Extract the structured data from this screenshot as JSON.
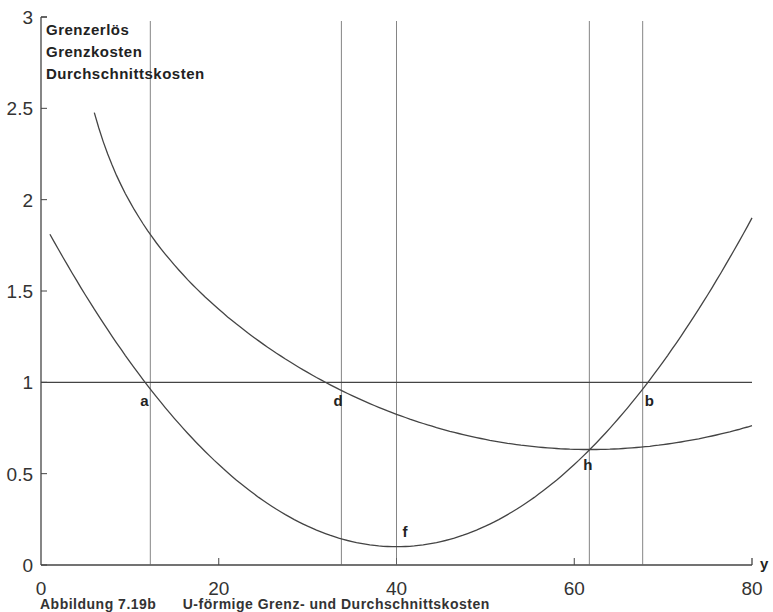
{
  "chart_data": {
    "type": "line",
    "title": "",
    "legend": [
      "Grenzerlös",
      "Grenzkosten",
      "Durchschnittskosten"
    ],
    "legend_position": "top-left",
    "xlabel": "y",
    "ylabel": "",
    "xlim": [
      0,
      80
    ],
    "ylim": [
      0,
      3
    ],
    "x_ticks": [
      0,
      20,
      40,
      60,
      80
    ],
    "y_ticks": [
      0,
      0.5,
      1,
      1.5,
      2,
      2.5,
      3
    ],
    "y_tick_labels": [
      "0",
      "0.5",
      "1",
      "1.5",
      "2",
      "2.5",
      "3"
    ],
    "grid": false,
    "series": [
      {
        "name": "Grenzerlös",
        "x": [
          0,
          80
        ],
        "values": [
          1,
          1
        ]
      },
      {
        "name": "Grenzkosten",
        "x": [
          0,
          10,
          20,
          30,
          40,
          50,
          60,
          70,
          80
        ],
        "values": [
          1.9,
          1.11,
          0.55,
          0.21,
          0.1,
          0.21,
          0.55,
          1.11,
          1.9
        ]
      },
      {
        "name": "Durchschnittskosten",
        "x": [
          6,
          10,
          20,
          30,
          40,
          50,
          60,
          70,
          80
        ],
        "values": [
          2.58,
          1.99,
          1.4,
          1.08,
          0.86,
          0.74,
          0.67,
          0.69,
          0.79
        ]
      }
    ],
    "annotations": [
      {
        "label": "a",
        "x": 12.3,
        "y": 1.0
      },
      {
        "label": "d",
        "x": 33.8,
        "y": 1.0
      },
      {
        "label": "f",
        "x": 40,
        "y": 0.1
      },
      {
        "label": "h",
        "x": 61.7,
        "y": 0.66
      },
      {
        "label": "b",
        "x": 67.7,
        "y": 1.0
      }
    ],
    "vertical_lines_x": [
      12.3,
      33.8,
      40,
      61.7,
      67.7
    ]
  },
  "caption": "Abbildung 7.19b      U-förmige Grenz- und Durchschnittskosten"
}
